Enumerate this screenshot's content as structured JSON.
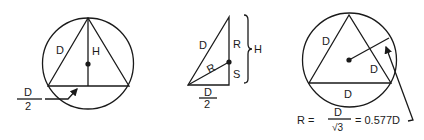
{
  "diagram": {
    "figures": [
      {
        "id": "circumscribed-triangle-height",
        "labels": {
          "side": "D",
          "height": "H",
          "half_base_num": "D",
          "half_base_den": "2"
        }
      },
      {
        "id": "half-triangle-decomposition",
        "labels": {
          "hypotenuse": "D",
          "radius_diag": "R",
          "upper_segment": "R",
          "lower_segment": "S",
          "height": "H",
          "base_num": "D",
          "base_den": "2"
        }
      },
      {
        "id": "circumradius-triangle",
        "labels": {
          "left_side": "D",
          "right_side": "D",
          "base": "D"
        },
        "formula": {
          "lhs": "R =",
          "frac_num": "D",
          "frac_den": "√3",
          "rhs": "= 0.577D"
        }
      }
    ]
  }
}
